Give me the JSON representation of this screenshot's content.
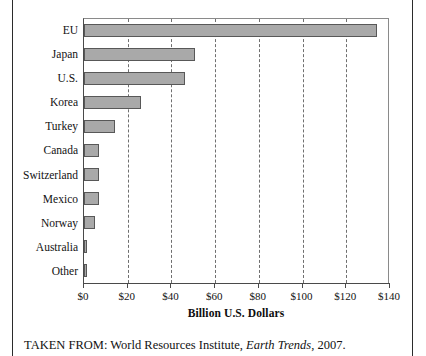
{
  "chart_data": {
    "type": "bar",
    "orientation": "horizontal",
    "title": "",
    "xlabel": "Billion U.S. Dollars",
    "ylabel": "",
    "categories": [
      "EU",
      "Japan",
      "U.S.",
      "Korea",
      "Turkey",
      "Canada",
      "Switzerland",
      "Mexico",
      "Norway",
      "Australia",
      "Other"
    ],
    "values": [
      134,
      51,
      46,
      26,
      14,
      7,
      7,
      7,
      5,
      1.5,
      1.5
    ],
    "xlim": [
      0,
      140
    ],
    "xticks": [
      0,
      20,
      40,
      60,
      80,
      100,
      120,
      140
    ],
    "xtick_labels": [
      "$0",
      "$20",
      "$40",
      "$60",
      "$80",
      "$100",
      "$120",
      "$140"
    ],
    "grid": "vertical-dashed",
    "legend": "none",
    "bar_color": "#a9a9a9",
    "bar_edge_color": "#585858"
  },
  "caption": {
    "prefix": "TAKEN FROM: World Resources Institute,",
    "italic_title": "Earth Trends",
    "suffix": ", 2007."
  }
}
